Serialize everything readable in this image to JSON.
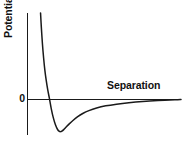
{
  "figure": {
    "background_color": "#ffffff",
    "ink_color": "#1a1a1a",
    "width": 182,
    "height": 149
  },
  "labels": {
    "y_axis": "Potential energy",
    "x_axis": "Separation",
    "zero_tick": "0"
  },
  "chart_data": {
    "type": "line",
    "title": "",
    "subtitle": "",
    "xlabel": "Separation",
    "ylabel": "Potential energy",
    "xlabel_position": "above-axis-right",
    "ylabel_position": "rotated-left",
    "grid": false,
    "legend": null,
    "axis_style": "origin-crossing-arrowless",
    "tick_labels": {
      "x": [],
      "y": [
        "0"
      ]
    },
    "xlim": [
      0,
      1
    ],
    "ylim": [
      -0.42,
      1.0
    ],
    "annotations": [
      {
        "text": "Separation",
        "x": 0.58,
        "y": 0.15,
        "role": "x-axis-label"
      },
      {
        "text": "0",
        "x": -0.04,
        "y": 0.0,
        "role": "y-axis-zero-tick"
      }
    ],
    "features": {
      "zero_crossing_x": 0.135,
      "minimum_x": 0.215,
      "minimum_y": -0.38,
      "asymptote_y": 0.0,
      "wall_x": 0.09
    },
    "series": [
      {
        "name": "Potential energy",
        "color": "#1a1a1a",
        "x": [
          0.085,
          0.09,
          0.097,
          0.105,
          0.113,
          0.122,
          0.132,
          0.143,
          0.155,
          0.168,
          0.182,
          0.196,
          0.208,
          0.215,
          0.224,
          0.236,
          0.252,
          0.272,
          0.296,
          0.325,
          0.36,
          0.4,
          0.45,
          0.51,
          0.58,
          0.66,
          0.75,
          0.85,
          0.96,
          1.0
        ],
        "y": [
          1.0,
          0.84,
          0.65,
          0.48,
          0.34,
          0.22,
          0.11,
          0.01,
          -0.11,
          -0.215,
          -0.3,
          -0.355,
          -0.378,
          -0.38,
          -0.374,
          -0.356,
          -0.325,
          -0.288,
          -0.248,
          -0.206,
          -0.166,
          -0.132,
          -0.101,
          -0.075,
          -0.055,
          -0.038,
          -0.024,
          -0.013,
          -0.004,
          0.0
        ]
      }
    ]
  }
}
